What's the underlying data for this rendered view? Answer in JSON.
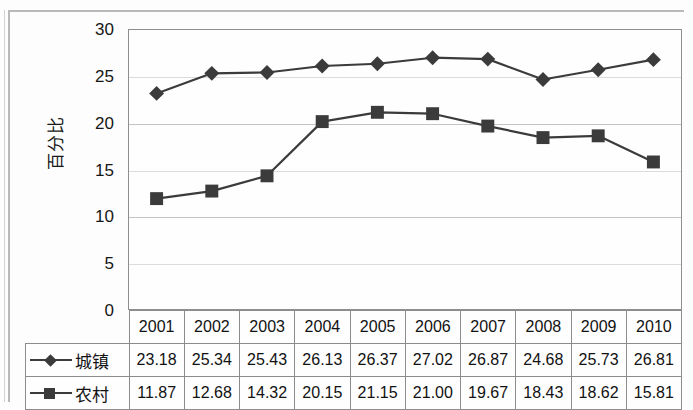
{
  "chart_data": {
    "type": "line",
    "title": "",
    "xlabel": "",
    "ylabel": "百分比",
    "ylim": [
      0,
      30
    ],
    "yticks": [
      0,
      5,
      10,
      15,
      20,
      25,
      30
    ],
    "ytick_labels": [
      "0",
      "5",
      "10",
      "15",
      "20",
      "25",
      "30"
    ],
    "grid": true,
    "legend_position": "table-row-labels",
    "categories": [
      "2001",
      "2002",
      "2003",
      "2004",
      "2005",
      "2006",
      "2007",
      "2008",
      "2009",
      "2010"
    ],
    "series": [
      {
        "name": "城镇",
        "marker": "diamond",
        "color": "#3b3b3b",
        "values": [
          23.18,
          25.34,
          25.43,
          26.13,
          26.37,
          27.02,
          26.87,
          24.68,
          25.73,
          26.81
        ],
        "value_labels": [
          "23.18",
          "25.34",
          "25.43",
          "26.13",
          "26.37",
          "27.02",
          "26.87",
          "24.68",
          "25.73",
          "26.81"
        ]
      },
      {
        "name": "农村",
        "marker": "square",
        "color": "#3b3b3b",
        "values": [
          11.87,
          12.68,
          14.32,
          20.15,
          21.15,
          21.0,
          19.67,
          18.43,
          18.62,
          15.81
        ],
        "value_labels": [
          "11.87",
          "12.68",
          "14.32",
          "20.15",
          "21.15",
          "21.00",
          "19.67",
          "18.43",
          "18.62",
          "15.81"
        ]
      }
    ]
  },
  "axis": {
    "y_title": "百分比"
  },
  "table": {
    "year_header": [
      "2001",
      "2002",
      "2003",
      "2004",
      "2005",
      "2006",
      "2007",
      "2008",
      "2009",
      "2010"
    ],
    "rows": [
      {
        "label": "城镇",
        "marker": "diamond",
        "values": [
          "23.18",
          "25.34",
          "25.43",
          "26.13",
          "26.37",
          "27.02",
          "26.87",
          "24.68",
          "25.73",
          "26.81"
        ]
      },
      {
        "label": "农村",
        "marker": "square",
        "values": [
          "11.87",
          "12.68",
          "14.32",
          "20.15",
          "21.15",
          "21.00",
          "19.67",
          "18.43",
          "18.62",
          "15.81"
        ]
      }
    ]
  }
}
